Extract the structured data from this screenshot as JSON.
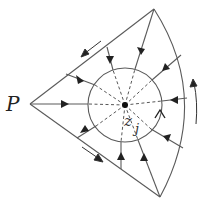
{
  "figure": {
    "labels": {
      "point_p": "P",
      "center_z": "z",
      "center_sub": "j"
    },
    "colors": {
      "stroke": "#555555",
      "dash": "#444444",
      "arrow": "#222222",
      "background": "#ffffff"
    },
    "geometry": {
      "vertex_p": [
        30,
        104
      ],
      "vertex_top": [
        154,
        9
      ],
      "vertex_bottom": [
        160,
        197
      ],
      "circle_center": [
        125,
        105
      ],
      "circle_radius": 37
    },
    "flow_direction": "inward toward z_j",
    "boundary_orientation": "counter-clockwise"
  }
}
